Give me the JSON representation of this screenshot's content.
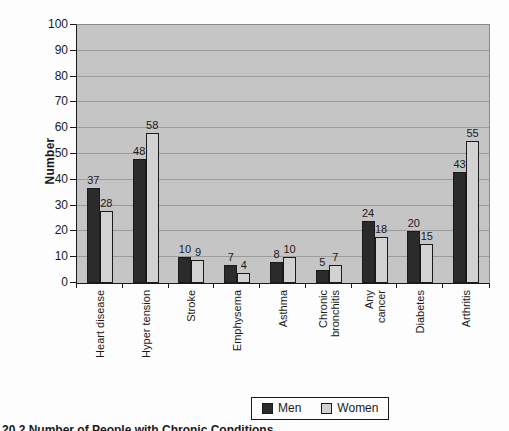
{
  "figure": {
    "cutoff_caption": "20.2 Number of People with Chronic Conditions"
  },
  "chart_data": {
    "type": "bar",
    "title": "",
    "ylabel": "Number",
    "xlabel": "",
    "ylim": [
      0,
      100
    ],
    "ytick_step": 10,
    "grid": true,
    "legend_position": "bottom-center",
    "categories": [
      "Heart disease",
      "Hyper tension",
      "Stroke",
      "Emphysema",
      "Asthma",
      "Chronic\nbronchitis",
      "Any\ncancer",
      "Diabetes",
      "Arthritis"
    ],
    "series": [
      {
        "name": "Men",
        "color": "#2b2b2b",
        "values": [
          37,
          48,
          10,
          7,
          8,
          5,
          24,
          20,
          43
        ]
      },
      {
        "name": "Women",
        "color": "#d2d2d2",
        "values": [
          28,
          58,
          9,
          4,
          10,
          7,
          18,
          15,
          55
        ]
      }
    ]
  },
  "colors": {
    "page_bg": "#fdfdfd",
    "plot_bg": "#c5c5c5",
    "gridline": "#9b9b9b",
    "axis": "#1a1a1a",
    "text": "#1a1a1a"
  }
}
